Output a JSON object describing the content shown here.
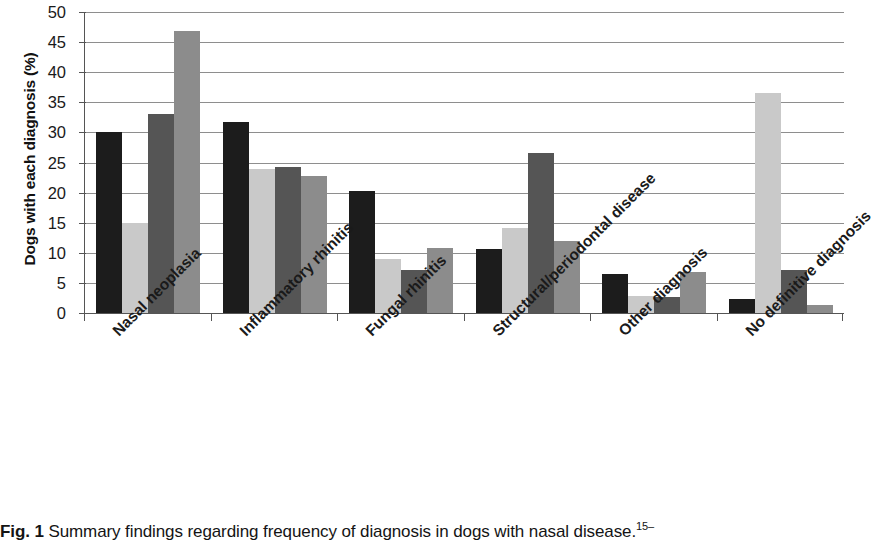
{
  "figure": {
    "caption_prefix": "Fig. 1",
    "caption_text": "Summary findings regarding frequency of diagnosis in dogs with nasal disease.",
    "caption_superscript": "15–"
  },
  "chart_data": {
    "type": "bar",
    "title": "",
    "xlabel": "",
    "ylabel": "Dogs with each diagnosis (%)",
    "ylim": [
      0,
      50
    ],
    "ytick_step": 5,
    "yticks": [
      "0",
      "5",
      "10",
      "15",
      "20",
      "25",
      "30",
      "35",
      "40",
      "45",
      "50"
    ],
    "grid": true,
    "legend": "none",
    "categories": [
      "Nasal neoplasia",
      "Inflammatory rhinitis",
      "Fungal rhinitis",
      "Structural/periodontal disease",
      "Other diagnosis",
      "No definitive diagnosis"
    ],
    "series": [
      {
        "name": "Series 1",
        "color": "#1c1c1c",
        "values": [
          30.0,
          31.7,
          20.2,
          10.7,
          6.4,
          2.3
        ]
      },
      {
        "name": "Series 2",
        "color": "#c9c9c9",
        "values": [
          15.0,
          23.9,
          9.0,
          14.1,
          2.8,
          36.5
        ]
      },
      {
        "name": "Series 3",
        "color": "#555555",
        "values": [
          33.0,
          24.3,
          7.2,
          26.5,
          2.6,
          7.2
        ]
      },
      {
        "name": "Series 4",
        "color": "#8c8c8c",
        "values": [
          46.8,
          22.8,
          10.8,
          12.0,
          6.8,
          1.4
        ]
      }
    ]
  }
}
